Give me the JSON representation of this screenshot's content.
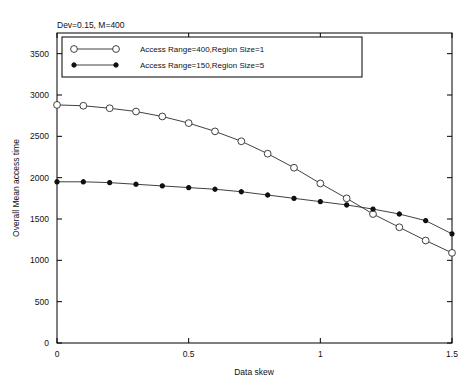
{
  "chart_data": {
    "type": "line",
    "title": "Dev=0.15, M=400",
    "xlabel": "Data skew",
    "ylabel": "Overall Mean access time",
    "xlim": [
      0,
      1.5
    ],
    "ylim": [
      0,
      3750
    ],
    "xticks": [
      0,
      0.5,
      1,
      1.5
    ],
    "xtick_labels": [
      "0",
      "0.5",
      "1",
      "1.5"
    ],
    "yticks": [
      0,
      500,
      1000,
      1500,
      2000,
      2500,
      3000,
      3500
    ],
    "ytick_labels": [
      "0",
      "500",
      "1000",
      "1500",
      "2000",
      "2500",
      "3000",
      "3500"
    ],
    "grid": false,
    "legend_position": "top-center",
    "x": [
      0,
      0.1,
      0.2,
      0.3,
      0.4,
      0.5,
      0.6,
      0.7,
      0.8,
      0.9,
      1.0,
      1.1,
      1.2,
      1.3,
      1.4,
      1.5
    ],
    "series": [
      {
        "name": "Access Range=400,Region Size=1",
        "marker": "open-circle",
        "values": [
          2880,
          2870,
          2840,
          2800,
          2740,
          2660,
          2560,
          2440,
          2290,
          2120,
          1930,
          1750,
          1560,
          1400,
          1240,
          1090
        ]
      },
      {
        "name": "Access Range=150,Region Size=5",
        "marker": "filled-star",
        "values": [
          1950,
          1950,
          1940,
          1920,
          1900,
          1880,
          1860,
          1830,
          1790,
          1750,
          1710,
          1670,
          1620,
          1560,
          1480,
          1320
        ]
      }
    ]
  }
}
